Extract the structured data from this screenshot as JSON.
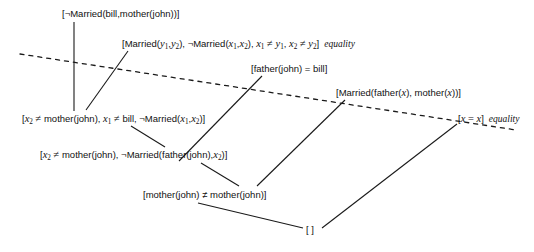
{
  "diagram": {
    "background_color": "#ffffff",
    "line_color": "#1a1a1a",
    "dotted_line_color": "#1a1a1a"
  },
  "nodes": [
    {
      "id": "n1",
      "name": "clause-not-married-bill-mother-john",
      "text": "[¬Married(bill,mother(john))]",
      "rule": "",
      "x": 62,
      "y": 8
    },
    {
      "id": "n2",
      "name": "clause-married-y1-y2-axiom",
      "text_parts": [
        "[Married(",
        "y",
        "1",
        ",",
        "y",
        "2",
        "), ¬Married(",
        "x",
        "1",
        ",",
        "x",
        "2",
        "), ",
        "x",
        "1",
        " ≠ ",
        "y",
        "1",
        ", ",
        "x",
        "2",
        " ≠ ",
        "y",
        "2",
        "]"
      ],
      "rule": "equality",
      "x": 122,
      "y": 38
    },
    {
      "id": "n3",
      "name": "clause-father-john-equals-bill",
      "text": "[father(john) = bill]",
      "rule": "",
      "x": 251,
      "y": 63
    },
    {
      "id": "n4",
      "name": "clause-married-father-x-mother-x",
      "text": "[Married(father(x), mother(x))]",
      "rule": "",
      "x": 336,
      "y": 87
    },
    {
      "id": "n5",
      "name": "clause-x2-neq-mother-john-x1-neq-bill",
      "rule": "",
      "x": 22,
      "y": 113
    },
    {
      "id": "n6",
      "name": "clause-x-equals-x-axiom",
      "text": "[x = x]",
      "rule": "equality",
      "x": 458,
      "y": 113
    },
    {
      "id": "n7",
      "name": "clause-x2-neq-mother-john-not-married-father-john",
      "rule": "",
      "x": 40,
      "y": 149
    },
    {
      "id": "n8",
      "name": "clause-mother-john-neq-mother-john",
      "text": "[mother(john) ≠ mother(john)]",
      "rule": "",
      "x": 143,
      "y": 189
    },
    {
      "id": "n9",
      "name": "clause-empty",
      "text": "[ ]",
      "rule": "",
      "x": 306,
      "y": 224
    }
  ],
  "node_texts": {
    "n1": "[¬Married(bill,mother(john))]",
    "n3": "[father(john) = bill]",
    "n4_a": "[Married(father(",
    "n4_x": "x",
    "n4_b": "), mother(",
    "n4_c": ")]",
    "n6": "]",
    "n8": "[mother(john) ≠ mother(john)]",
    "n9": "[ ]"
  },
  "labels": {
    "equality_1": "equality",
    "equality_2": "equality"
  },
  "edges": [
    {
      "name": "edge-n1-to-n5",
      "type": "solid",
      "x1": 74,
      "y1": 22,
      "x2": 74,
      "y2": 111
    },
    {
      "name": "edge-n2-to-n5",
      "type": "solid",
      "x1": 128,
      "y1": 51,
      "x2": 86,
      "y2": 110
    },
    {
      "name": "edge-n3-to-n7",
      "type": "solid",
      "x1": 262,
      "y1": 76,
      "x2": 179,
      "y2": 161
    },
    {
      "name": "edge-n4-to-n8",
      "type": "solid",
      "x1": 345,
      "y1": 100,
      "x2": 257,
      "y2": 186
    },
    {
      "name": "edge-n5-to-n7",
      "type": "solid",
      "x1": 131,
      "y1": 126,
      "x2": 164,
      "y2": 147
    },
    {
      "name": "edge-n7-to-n8",
      "type": "solid",
      "x1": 200,
      "y1": 163,
      "x2": 238,
      "y2": 186
    },
    {
      "name": "edge-n8-to-n9",
      "type": "solid",
      "x1": 198,
      "y1": 203,
      "x2": 303,
      "y2": 228
    },
    {
      "name": "edge-n6-to-n9",
      "type": "solid",
      "x1": 457,
      "y1": 124,
      "x2": 322,
      "y2": 228
    },
    {
      "name": "edge-dotted-separator",
      "type": "dotted",
      "x1": 20,
      "y1": 54,
      "x2": 516,
      "y2": 130
    }
  ]
}
